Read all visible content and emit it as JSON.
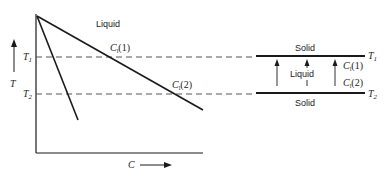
{
  "figure": {
    "left_panel": {
      "y_axis_label": "T",
      "x_axis_label": "C",
      "region_label": "Liquid",
      "levels": [
        {
          "symbol": "T",
          "sub": "1"
        },
        {
          "symbol": "T",
          "sub": "2"
        }
      ],
      "curve_labels": [
        {
          "symbol": "C",
          "sub": "l",
          "suffix": "(1)"
        },
        {
          "symbol": "C",
          "sub": "l",
          "suffix": "(2)"
        }
      ]
    },
    "right_panel": {
      "top_region": "Solid",
      "middle_region": "Liquid",
      "bottom_region": "Solid",
      "levels": [
        {
          "symbol": "T",
          "sub": "1"
        },
        {
          "symbol": "T",
          "sub": "2"
        }
      ],
      "concentration_labels": [
        {
          "symbol": "C",
          "sub": "l",
          "suffix": "(1)"
        },
        {
          "symbol": "C",
          "sub": "l",
          "suffix": "(2)"
        }
      ]
    },
    "colors": {
      "line": "#1a1a1a",
      "dash": "#555555"
    }
  }
}
